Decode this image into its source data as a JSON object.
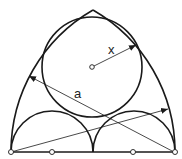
{
  "diagram": {
    "labels": {
      "radius": "x",
      "span": "a"
    },
    "colors": {
      "stroke": "#1a1a1a",
      "background": "#ffffff"
    },
    "points": [
      {
        "name": "left-base",
        "x": 11,
        "y": 152
      },
      {
        "name": "left-quarter",
        "x": 52,
        "y": 152
      },
      {
        "name": "right-quarter",
        "x": 133,
        "y": 152
      },
      {
        "name": "right-base",
        "x": 175,
        "y": 152
      },
      {
        "name": "circle-center",
        "x": 92,
        "y": 67
      }
    ]
  }
}
